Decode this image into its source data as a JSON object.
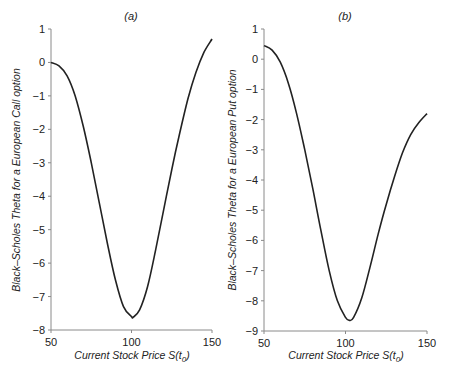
{
  "chart_data": [
    {
      "type": "line",
      "panel": "(a)",
      "title": "(a)",
      "xlabel": "Current Stock Price S(t0)",
      "xlabel_main": "Current Stock Price S(t",
      "xlabel_sub": "0",
      "xlabel_tail": ")",
      "ylabel": "Black–Scholes Theta for a European Call option",
      "xlim": [
        50,
        150
      ],
      "ylim": [
        -8,
        1
      ],
      "xticks": [
        50,
        100,
        150
      ],
      "yticks": [
        1,
        0,
        -1,
        -2,
        -3,
        -4,
        -5,
        -6,
        -7,
        -8
      ],
      "grid": false,
      "series": [
        {
          "name": "Call Theta",
          "x": [
            50,
            55,
            60,
            65,
            70,
            75,
            80,
            85,
            90,
            95,
            100,
            101,
            105,
            110,
            115,
            120,
            125,
            130,
            135,
            140,
            145,
            150
          ],
          "y": [
            0.0,
            -0.1,
            -0.4,
            -1.0,
            -1.9,
            -3.0,
            -4.2,
            -5.4,
            -6.5,
            -7.3,
            -7.6,
            -7.62,
            -7.4,
            -6.7,
            -5.6,
            -4.4,
            -3.2,
            -2.1,
            -1.1,
            -0.3,
            0.3,
            0.7
          ]
        }
      ]
    },
    {
      "type": "line",
      "panel": "(b)",
      "title": "(b)",
      "xlabel": "Current Stock Price S(t0)",
      "xlabel_main": "Current Stock Price S(t",
      "xlabel_sub": "0",
      "xlabel_tail": ")",
      "ylabel": "Black–Scholes Theta for a European Put option",
      "xlim": [
        50,
        150
      ],
      "ylim": [
        -9,
        1
      ],
      "xticks": [
        50,
        100,
        150
      ],
      "yticks": [
        1,
        0,
        -1,
        -2,
        -3,
        -4,
        -5,
        -6,
        -7,
        -8,
        -9
      ],
      "grid": false,
      "series": [
        {
          "name": "Put Theta",
          "x": [
            50,
            55,
            60,
            65,
            70,
            75,
            80,
            85,
            90,
            95,
            100,
            102.5,
            105,
            110,
            115,
            120,
            125,
            130,
            135,
            140,
            145,
            150
          ],
          "y": [
            0.45,
            0.3,
            -0.1,
            -0.8,
            -1.8,
            -3.0,
            -4.3,
            -5.7,
            -7.0,
            -8.0,
            -8.55,
            -8.65,
            -8.55,
            -7.9,
            -6.9,
            -5.8,
            -4.8,
            -3.9,
            -3.1,
            -2.5,
            -2.1,
            -1.8
          ]
        }
      ]
    }
  ]
}
